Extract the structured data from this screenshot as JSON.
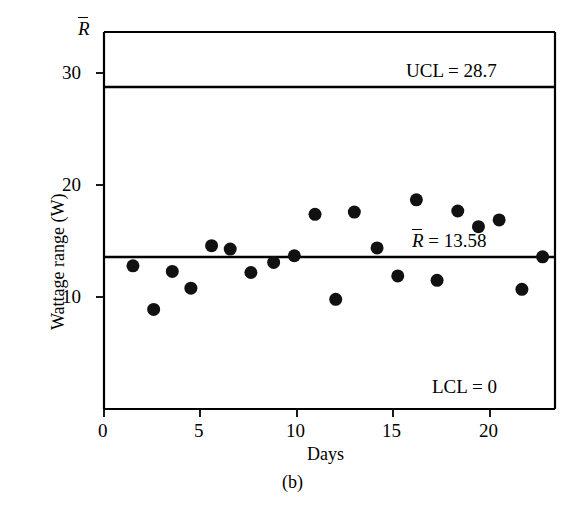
{
  "figure": {
    "caption": "(b)",
    "corner_axis_label": "R",
    "corner_axis_label_has_overbar": true
  },
  "axes": {
    "x": {
      "title": "Days",
      "ticks": [
        0,
        5,
        10,
        15,
        20
      ],
      "tick_labels": [
        "0",
        "5",
        "10",
        "15",
        "20"
      ],
      "range": [
        0,
        21.8
      ]
    },
    "y": {
      "title": "Wattage range (W)",
      "ticks": [
        10,
        20,
        30
      ],
      "tick_labels": [
        "10",
        "20",
        "30"
      ],
      "range": [
        0,
        33.7
      ]
    }
  },
  "control_limits": {
    "ucl_label": "UCL = 28.7",
    "ucl_value": 28.7,
    "center_label": "R = 13.58",
    "center_label_prefix": "R",
    "center_label_suffix": " = 13.58",
    "center_value": 13.58,
    "lcl_label": "LCL = 0",
    "lcl_value": 0
  },
  "style": {
    "line_color": "#000000",
    "marker_color": "#111111",
    "background": "#ffffff",
    "marker_radius": 6.5
  },
  "chart_data": {
    "type": "scatter",
    "title": "",
    "subtitle": "",
    "xlabel": "Days",
    "ylabel": "Wattage range (W)",
    "xlim": [
      0,
      21.8
    ],
    "ylim": [
      0,
      33.7
    ],
    "grid": false,
    "legend": "none",
    "x": [
      1.4,
      2.4,
      3.3,
      4.2,
      5.2,
      6.1,
      7.1,
      8.2,
      9.2,
      10.2,
      11.2,
      12.1,
      13.2,
      14.2,
      15.1,
      16.1,
      17.1,
      18.1,
      19.1,
      20.2,
      21.2
    ],
    "values": [
      12.8,
      8.9,
      12.3,
      10.8,
      14.6,
      14.3,
      12.2,
      13.1,
      13.7,
      17.4,
      9.8,
      17.6,
      14.4,
      11.9,
      18.7,
      11.5,
      17.7,
      16.3,
      16.9,
      10.7,
      13.6
    ],
    "series": [
      {
        "name": "Wattage range",
        "values": [
          12.8,
          8.9,
          12.3,
          10.8,
          14.6,
          14.3,
          12.2,
          13.1,
          13.7,
          17.4,
          9.8,
          17.6,
          14.4,
          11.9,
          18.7,
          11.5,
          17.7,
          16.3,
          16.9,
          10.7,
          13.6
        ]
      }
    ],
    "reference_lines": [
      {
        "name": "UCL",
        "value": 28.7,
        "label": "UCL = 28.7"
      },
      {
        "name": "CL",
        "value": 13.58,
        "label": "R = 13.58"
      },
      {
        "name": "LCL",
        "value": 0,
        "label": "LCL = 0"
      }
    ],
    "annotations": [
      "UCL = 28.7",
      "R = 13.58",
      "LCL = 0",
      "(b)"
    ]
  }
}
